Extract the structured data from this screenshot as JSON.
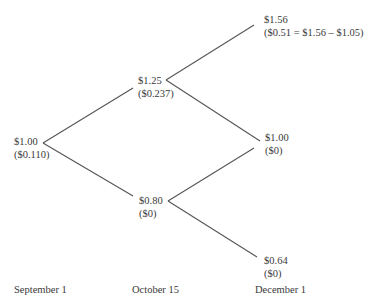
{
  "diagram": {
    "type": "binomial-tree",
    "nodes": {
      "root": {
        "price": "$1.00",
        "value": "($0.110)"
      },
      "up": {
        "price": "$1.25",
        "value": "($0.237)"
      },
      "down": {
        "price": "$0.80",
        "value": "($0)"
      },
      "up_up": {
        "price": "$1.56",
        "value": "($0.51 = $1.56 – $1.05)"
      },
      "up_down": {
        "price": "$1.00",
        "value": "($0)"
      },
      "down_down": {
        "price": "$0.64",
        "value": "($0)"
      }
    },
    "dates": [
      "September 1",
      "October 15",
      "December 1"
    ],
    "edges": [
      {
        "from": "root",
        "to": "up"
      },
      {
        "from": "root",
        "to": "down"
      },
      {
        "from": "up",
        "to": "up_up"
      },
      {
        "from": "up",
        "to": "up_down"
      },
      {
        "from": "down",
        "to": "up_down"
      },
      {
        "from": "down",
        "to": "down_down"
      }
    ],
    "line_color": "#555555",
    "text_color": "#3a3a3a"
  }
}
